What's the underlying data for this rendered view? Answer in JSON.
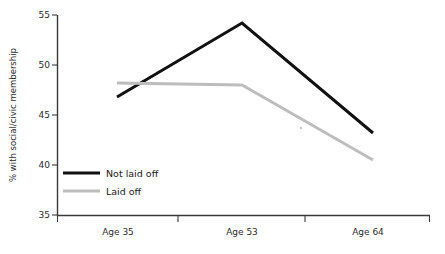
{
  "chart_data": {
    "type": "line",
    "title": "",
    "subtitle": "",
    "xlabel": "",
    "ylabel": "% with social/civic membership",
    "categories": [
      "Age 35",
      "Age 53",
      "Age 64"
    ],
    "x": [
      "Age 35",
      "Age 53",
      "Age 64"
    ],
    "series": [
      {
        "name": "Not laid off",
        "color": "#111111",
        "values": [
          46.8,
          54.2,
          43.2
        ]
      },
      {
        "name": "Laid off",
        "color": "#bdbdbd",
        "values": [
          48.2,
          48.0,
          40.5
        ]
      }
    ],
    "ylim": [
      35,
      55
    ],
    "yticks": [
      35,
      40,
      45,
      50,
      55
    ],
    "ytick_labels": [
      "35",
      "40",
      "45",
      "50",
      "55"
    ],
    "grid": false,
    "legend_position": "inside-lower-left",
    "annotations": []
  },
  "axes": {
    "y_title": "% with social/civic membership",
    "y_tick_labels": [
      "55",
      "50",
      "45",
      "40",
      "35"
    ],
    "x_tick_labels": [
      "Age 35",
      "Age 53",
      "Age 64"
    ]
  },
  "legend": {
    "items": [
      {
        "label": "Not laid off",
        "color": "#111111"
      },
      {
        "label": "Laid off",
        "color": "#bdbdbd"
      }
    ]
  },
  "colors": {
    "not_laid_off": "#111111",
    "laid_off": "#bdbdbd",
    "axis": "#3a3a3a",
    "text": "#2b2b2b",
    "background": "#ffffff"
  }
}
